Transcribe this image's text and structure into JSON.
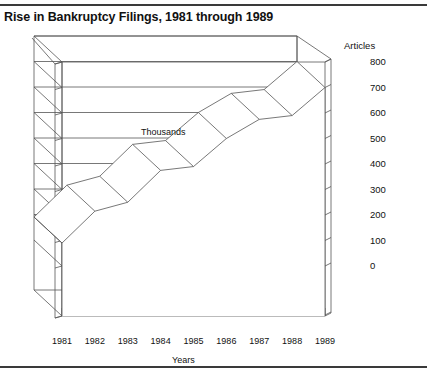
{
  "title": "Rise in Bankruptcy Filings, 1981 through 1989",
  "axis": {
    "y_title": "Articles",
    "x_title": "Years",
    "annotation": "Thousands"
  },
  "chart_data": {
    "type": "area",
    "title": "Rise in Bankruptcy Filings, 1981 through 1989",
    "subtitle": "",
    "xlabel": "Years",
    "ylabel": "Articles",
    "annotation": "Thousands",
    "style": "3d-ribbon-area",
    "grid": true,
    "legend": "none",
    "categories": [
      "1981",
      "1982",
      "1983",
      "1984",
      "1985",
      "1986",
      "1987",
      "1988",
      "1989"
    ],
    "values": [
      90,
      215,
      250,
      375,
      390,
      500,
      575,
      590,
      700
    ],
    "ylim": [
      0,
      800
    ],
    "yticks": [
      "800",
      "700",
      "600",
      "500",
      "400",
      "300",
      "200",
      "100",
      "0"
    ],
    "ytick_values": [
      800,
      700,
      600,
      500,
      400,
      300,
      200,
      100,
      0
    ],
    "xticks": [
      "1981",
      "1982",
      "1983",
      "1984",
      "1985",
      "1986",
      "1987",
      "1988",
      "1989"
    ]
  }
}
